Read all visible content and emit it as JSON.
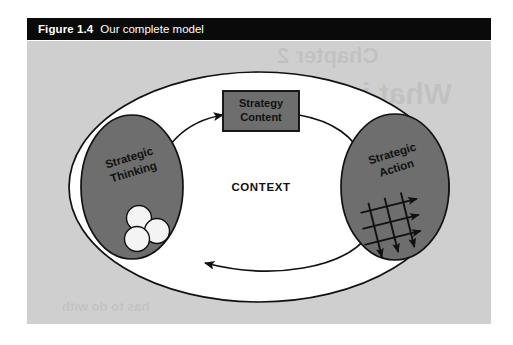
{
  "caption": {
    "label": "Figure 1.4",
    "title": "Our complete model"
  },
  "figure": {
    "background_color": "#cfcfcf",
    "panel_color": "#ffffff",
    "node_fill": "#6e6e6e",
    "stroke_color": "#111111",
    "container_label": "CONTEXT",
    "nodes": [
      {
        "id": "strategic-thinking",
        "line1": "Strategic",
        "line2": "Thinking",
        "shape": "ellipse",
        "motif": "three-overlapping-circles"
      },
      {
        "id": "strategy-content",
        "line1": "Strategy",
        "line2": "Content",
        "shape": "rectangle",
        "motif": "none"
      },
      {
        "id": "strategic-action",
        "line1": "Strategic",
        "line2": "Action",
        "shape": "ellipse",
        "motif": "arrow-grid"
      }
    ],
    "connectors": [
      {
        "id": "thinking-to-content",
        "from": "strategic-thinking",
        "to": "strategy-content",
        "style": "curved-arrow"
      },
      {
        "id": "content-to-action",
        "from": "strategy-content",
        "to": "strategic-action",
        "style": "curved-arrow"
      },
      {
        "id": "action-to-thinking",
        "from": "strategic-action",
        "to": "strategic-thinking",
        "style": "curved-arrow"
      }
    ],
    "ghost_text": {
      "line1": "Chapter 2",
      "line2": "What is strategy?",
      "line3": "the Art of war",
      "line4": "has to do with"
    }
  }
}
